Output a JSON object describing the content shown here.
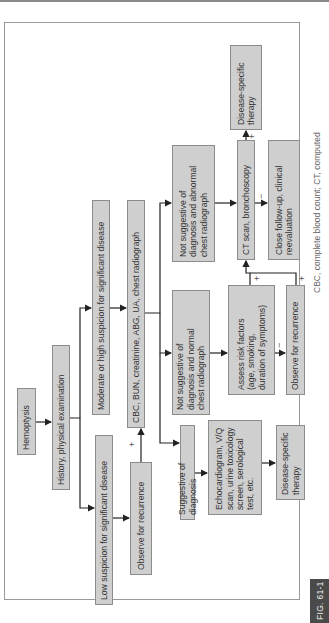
{
  "figure": {
    "label": "FIG. 61-1",
    "caption_fragment": "CBC, complete blood count; CT, computed",
    "orientation": "rotated 90° counter-clockwise"
  },
  "nodes": {
    "hemoptysis": "Hemoptysis",
    "history": "History, physical examination",
    "moderate_high": "Moderate or high suspicion for significant disease",
    "low": "Low suspicion for significant disease",
    "labs": "CBC, BUN, creatinine, ABG, UA, chest radiograph",
    "observe_left": "Observe for recurrence",
    "suggestive": "Suggestive of diagnosis",
    "not_suggestive_normal": [
      "Not suggestive of",
      "diagnosis and normal",
      "chest radiograph"
    ],
    "not_suggestive_abnormal": [
      "Not suggestive of",
      "diagnosis and abnormal",
      "chest radiograph"
    ],
    "workup": [
      "Echocardiogram, V/Q",
      "scan, urine toxicology",
      "screen, serological",
      "test, etc."
    ],
    "therapy_bottom": [
      "Disease-specific",
      "therapy"
    ],
    "assess_risk": [
      "Assess risk factors",
      "(age, smoking,",
      "duration of symptoms)"
    ],
    "observe_right": "Observe for recurrence",
    "ct_bronch": "CT scan, bronchoscopy",
    "follow_up": [
      "Close follow-up, clinical",
      "reevaluation"
    ],
    "therapy_top": [
      "Disease-specific",
      "therapy"
    ]
  },
  "edge_labels": {
    "observe_left_plus": "+",
    "assess_plus": "+",
    "assess_minus": "−",
    "observe_right_plus": "+",
    "ct_plus": "+",
    "ct_minus": "−"
  },
  "colors": {
    "box_fill": "#cfcfcf",
    "box_border": "#8c8c8c",
    "line": "#222222",
    "fig_tag_bg": "#4a4a4a"
  }
}
